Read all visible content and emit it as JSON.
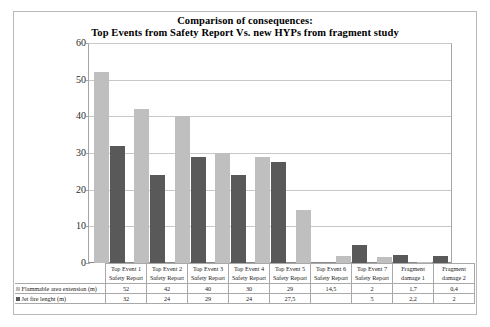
{
  "chart_data": {
    "type": "bar",
    "title": "Comparison of consequences:\nTop Events from Safety Report Vs. new HYPs from fragment study",
    "title_line1": "Comparison of consequences:",
    "title_line2": "Top Events from Safety Report Vs. new HYPs from fragment study",
    "xlabel": "",
    "ylabel": "",
    "ylim": [
      0,
      60
    ],
    "yticks": [
      0,
      10,
      20,
      30,
      40,
      50,
      60
    ],
    "grid": true,
    "legend_position": "table",
    "categories": [
      "Top Event 1 Safety Report",
      "Top Event 2 Safety Report",
      "Top Event 3 Safety Report",
      "Top Event 4 Safety Report",
      "Top Event 5 Safety Report",
      "Top Event 6 Safety Report",
      "Top Event 7 Safety Report",
      "Fragment damage 1",
      "Fragment damage 2"
    ],
    "category_lines": [
      [
        "Top Event 1",
        "Safety Report"
      ],
      [
        "Top Event 2",
        "Safety Report"
      ],
      [
        "Top Event 3",
        "Safety Report"
      ],
      [
        "Top Event 4",
        "Safety Report"
      ],
      [
        "Top Event 5",
        "Safety Report"
      ],
      [
        "Top Event 6",
        "Safety Report"
      ],
      [
        "Top Event 7",
        "Safety Report"
      ],
      [
        "Fragment",
        "damage 1"
      ],
      [
        "Fragment",
        "damage 2"
      ]
    ],
    "series": [
      {
        "name": "Flammable area extension (m)",
        "color": "#bfbfbf",
        "values": [
          52,
          42,
          40,
          30,
          29,
          14.5,
          2,
          1.7,
          0.4
        ],
        "labels": [
          "52",
          "42",
          "40",
          "30",
          "29",
          "14,5",
          "2",
          "1,7",
          "0,4"
        ]
      },
      {
        "name": "Jet fire lenght (m)",
        "color": "#595959",
        "values": [
          32,
          24,
          29,
          24,
          27.5,
          null,
          5,
          2.2,
          2
        ],
        "labels": [
          "32",
          "24",
          "29",
          "24",
          "27,5",
          "",
          "5",
          "2,2",
          "2"
        ]
      }
    ]
  }
}
